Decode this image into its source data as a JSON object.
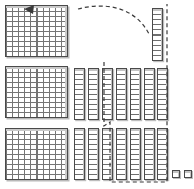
{
  "canvas": {
    "width": 194,
    "height": 189,
    "background": "#ffffff"
  },
  "manipulative": {
    "name": "base-ten-blocks",
    "description": "Base ten blocks regrouping diagram",
    "colors": {
      "outline": "#4a4a4a",
      "gridline": "#6e6e6e",
      "shadow": "#bdbdbd",
      "bevel": "#c4c4c4",
      "dashed_overlay": "#3a3a3a",
      "fill": "#ffffff"
    }
  },
  "counts": {
    "flats": 3,
    "rods_total": 15,
    "rods_middle_row": 7,
    "rods_bottom_row": 7,
    "rods_top_right": 1,
    "units": 2,
    "cells_per_flat": 100,
    "cells_per_rod": 10,
    "flat_grid_cols": 10,
    "flat_grid_rows": 10
  },
  "value": {
    "hundreds": 3,
    "tens": 15,
    "ones": 2,
    "total": 452
  },
  "flats": [
    {
      "id": "flat-1",
      "label": "hundred-flat-1",
      "x": 5,
      "y": 5,
      "w": 63,
      "h": 52
    },
    {
      "id": "flat-2",
      "label": "hundred-flat-2",
      "x": 5,
      "y": 66,
      "w": 63,
      "h": 52
    },
    {
      "id": "flat-3",
      "label": "hundred-flat-3",
      "x": 5,
      "y": 128,
      "w": 63,
      "h": 52
    }
  ],
  "rods": [
    {
      "id": "rod-top-1",
      "label": "ten-rod-top-1",
      "x": 152,
      "y": 8,
      "w": 11,
      "h": 53,
      "group": "top-right"
    },
    {
      "id": "rod-mid-1",
      "label": "ten-rod-mid-1",
      "x": 74,
      "y": 68,
      "w": 11,
      "h": 52,
      "group": "middle-row"
    },
    {
      "id": "rod-mid-2",
      "label": "ten-rod-mid-2",
      "x": 88,
      "y": 68,
      "w": 11,
      "h": 52,
      "group": "middle-row"
    },
    {
      "id": "rod-mid-3",
      "label": "ten-rod-mid-3",
      "x": 102,
      "y": 68,
      "w": 11,
      "h": 52,
      "group": "middle-row"
    },
    {
      "id": "rod-mid-4",
      "label": "ten-rod-mid-4",
      "x": 116,
      "y": 68,
      "w": 11,
      "h": 52,
      "group": "middle-row"
    },
    {
      "id": "rod-mid-5",
      "label": "ten-rod-mid-5",
      "x": 130,
      "y": 68,
      "w": 11,
      "h": 52,
      "group": "middle-row"
    },
    {
      "id": "rod-mid-6",
      "label": "ten-rod-mid-6",
      "x": 144,
      "y": 68,
      "w": 11,
      "h": 52,
      "group": "middle-row"
    },
    {
      "id": "rod-mid-7",
      "label": "ten-rod-mid-7",
      "x": 157,
      "y": 68,
      "w": 11,
      "h": 52,
      "group": "middle-row"
    },
    {
      "id": "rod-bot-1",
      "label": "ten-rod-bot-1",
      "x": 74,
      "y": 128,
      "w": 11,
      "h": 52,
      "group": "bottom-row"
    },
    {
      "id": "rod-bot-2",
      "label": "ten-rod-bot-2",
      "x": 88,
      "y": 128,
      "w": 11,
      "h": 52,
      "group": "bottom-row"
    },
    {
      "id": "rod-bot-3",
      "label": "ten-rod-bot-3",
      "x": 102,
      "y": 128,
      "w": 11,
      "h": 52,
      "group": "bottom-row"
    },
    {
      "id": "rod-bot-4",
      "label": "ten-rod-bot-4",
      "x": 116,
      "y": 128,
      "w": 11,
      "h": 52,
      "group": "bottom-row"
    },
    {
      "id": "rod-bot-5",
      "label": "ten-rod-bot-5",
      "x": 130,
      "y": 128,
      "w": 11,
      "h": 52,
      "group": "bottom-row"
    },
    {
      "id": "rod-bot-6",
      "label": "ten-rod-bot-6",
      "x": 144,
      "y": 128,
      "w": 11,
      "h": 52,
      "group": "bottom-row"
    },
    {
      "id": "rod-bot-7",
      "label": "ten-rod-bot-7",
      "x": 157,
      "y": 128,
      "w": 11,
      "h": 52,
      "group": "bottom-row"
    }
  ],
  "units": [
    {
      "id": "unit-1",
      "label": "one-cube-1",
      "x": 172,
      "y": 170,
      "w": 8,
      "h": 8
    },
    {
      "id": "unit-2",
      "label": "one-cube-2",
      "x": 184,
      "y": 170,
      "w": 8,
      "h": 8
    }
  ],
  "overlay": {
    "selection_region_name": "dashed-selection-region",
    "selection_path": "M 104 62 L 104 126 L 110 122 L 110 182 L 167 182 L 167 4",
    "arrow_name": "regroup-arrow",
    "arrow_path": "M 78 9 C 104 2 136 6 150 36",
    "arrow_head": "24,9 34,5 33,14",
    "dash_pattern": "4 3",
    "stroke_color": "#3a3a3a",
    "stroke_width": 1.2
  }
}
